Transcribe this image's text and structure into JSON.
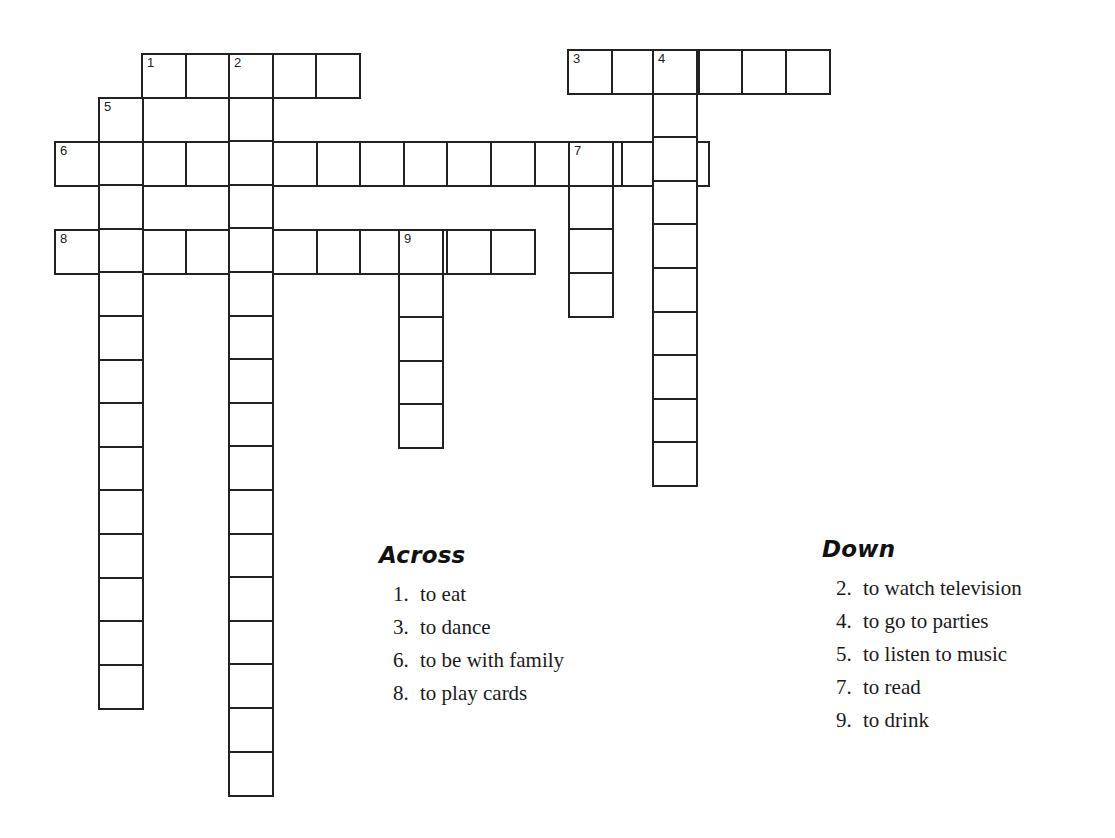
{
  "puzzle": {
    "cell_size": 43.6,
    "border_color": "#222222",
    "words": [
      {
        "number": "1",
        "direction": "across",
        "x": 141,
        "y": 53,
        "length": 5,
        "inner_numbers": [
          {
            "index": 2,
            "number": "2"
          }
        ]
      },
      {
        "number": "3",
        "direction": "across",
        "x": 567,
        "y": 49,
        "length": 6,
        "inner_numbers": [
          {
            "index": 2,
            "number": "4"
          }
        ]
      },
      {
        "number": "6",
        "direction": "across",
        "x": 54,
        "y": 141,
        "length": 15,
        "inner_numbers": [
          {
            "index": 12,
            "number": "7"
          }
        ]
      },
      {
        "number": "8",
        "direction": "across",
        "x": 54,
        "y": 229,
        "length": 11,
        "inner_numbers": [
          {
            "index": 8,
            "number": "9"
          }
        ]
      },
      {
        "number": "2",
        "direction": "down",
        "x": 228,
        "y": 53,
        "length": 17,
        "inner_numbers": []
      },
      {
        "number": "4",
        "direction": "down",
        "x": 652,
        "y": 49,
        "length": 10,
        "inner_numbers": []
      },
      {
        "number": "5",
        "direction": "down",
        "x": 98,
        "y": 97,
        "length": 14,
        "inner_numbers": []
      },
      {
        "number": "7",
        "direction": "down",
        "x": 568,
        "y": 141,
        "length": 4,
        "inner_numbers": []
      },
      {
        "number": "9",
        "direction": "down",
        "x": 398,
        "y": 229,
        "length": 5,
        "inner_numbers": []
      }
    ]
  },
  "clues": {
    "across": {
      "heading": "Across",
      "items": [
        {
          "num": "1.",
          "text": "to eat"
        },
        {
          "num": "3.",
          "text": "to dance"
        },
        {
          "num": "6.",
          "text": "to be with family"
        },
        {
          "num": "8.",
          "text": "to play cards"
        }
      ]
    },
    "down": {
      "heading": "Down",
      "items": [
        {
          "num": "2.",
          "text": "to watch television"
        },
        {
          "num": "4.",
          "text": "to go to parties"
        },
        {
          "num": "5.",
          "text": "to listen to music"
        },
        {
          "num": "7.",
          "text": "to read"
        },
        {
          "num": "9.",
          "text": "to drink"
        }
      ]
    }
  }
}
